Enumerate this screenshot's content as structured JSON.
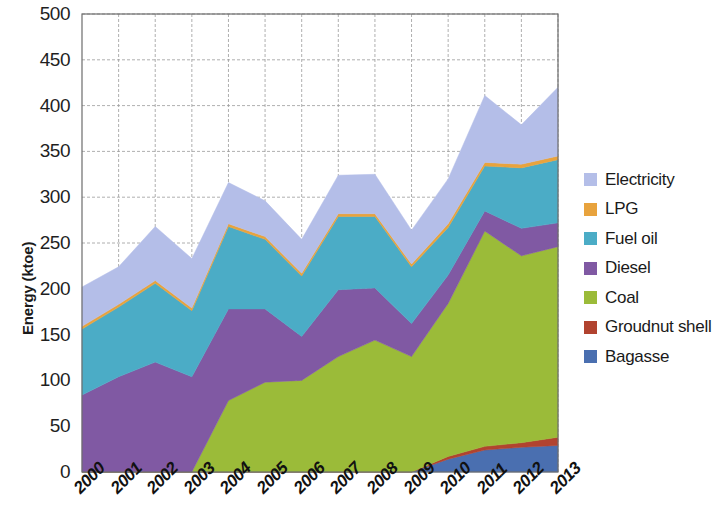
{
  "chart_data": {
    "type": "area",
    "stacked": true,
    "title": "",
    "xlabel": "",
    "ylabel": "Energy (ktoe)",
    "categories": [
      "2000",
      "2001",
      "2002",
      "2003",
      "2004",
      "2005",
      "2006",
      "2007",
      "2008",
      "2009",
      "2010",
      "2011",
      "2012",
      "2013"
    ],
    "ylim": [
      0,
      500
    ],
    "yticks": [
      0,
      50,
      100,
      150,
      200,
      250,
      300,
      350,
      400,
      450,
      500
    ],
    "grid": true,
    "legend_position": "right",
    "series": [
      {
        "name": "Bagasse",
        "color": "#4A6FB0",
        "values": [
          0,
          0,
          0,
          0,
          0,
          0,
          0,
          0,
          0,
          0,
          14,
          24,
          27,
          29
        ]
      },
      {
        "name": "Groudnut shell",
        "color": "#B1432F",
        "values": [
          0,
          0,
          0,
          0,
          0,
          0,
          0,
          0,
          0,
          0,
          3,
          4,
          5,
          9
        ]
      },
      {
        "name": "Coal",
        "color": "#9BBB39",
        "values": [
          0,
          0,
          0,
          0,
          78,
          98,
          100,
          126,
          144,
          126,
          167,
          235,
          204,
          208
        ]
      },
      {
        "name": "Diesel",
        "color": "#8059A3",
        "values": [
          84,
          104,
          120,
          104,
          100,
          80,
          48,
          73,
          57,
          36,
          31,
          22,
          30,
          26
        ]
      },
      {
        "name": "Fuel oil",
        "color": "#4BACC6",
        "values": [
          72,
          76,
          86,
          72,
          90,
          76,
          66,
          80,
          78,
          62,
          52,
          49,
          66,
          69
        ]
      },
      {
        "name": "LPG",
        "color": "#E8A33D",
        "values": [
          3,
          3,
          3,
          3,
          3,
          3,
          3,
          3,
          3,
          3,
          4,
          4,
          4,
          4
        ]
      },
      {
        "name": "Electricity",
        "color": "#B4BEE8",
        "values": [
          43,
          41,
          59,
          54,
          45,
          39,
          37,
          42,
          43,
          37,
          49,
          73,
          43,
          75
        ]
      }
    ]
  }
}
